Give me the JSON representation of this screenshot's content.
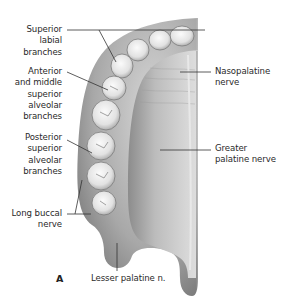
{
  "figure": {
    "panel_letter": "A",
    "labels": {
      "superior_labial": "Superior\nlabial\nbranches",
      "anterior_middle": "Anterior\nand middle\nsuperior\nalveolar\nbranches",
      "posterior_superior": "Posterior\nsuperior\nalveolar\nbranches",
      "long_buccal": "Long buccal\nnerve",
      "nasopalatine": "Nasopalatine\nnerve",
      "greater_palatine": "Greater\npalatine nerve",
      "lesser_palatine": "Lesser palatine n."
    },
    "colors": {
      "background": "#ffffff",
      "text": "#2a2a2a",
      "leader_line": "#333333",
      "gum": "#8a8a8a",
      "palate": "#c8c8c8",
      "tooth": "#eeeeee"
    }
  }
}
